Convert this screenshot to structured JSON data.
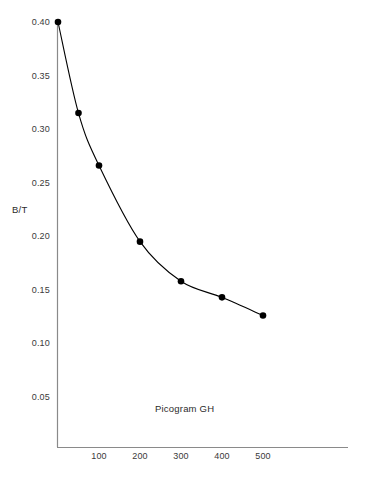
{
  "chart_data": {
    "type": "line",
    "title": "",
    "subtitle": "",
    "xlabel": "",
    "ylabel": "B/T",
    "annotation": "Picogram GH",
    "x": [
      0,
      50,
      100,
      200,
      300,
      400,
      500
    ],
    "values": [
      0.4,
      0.315,
      0.266,
      0.195,
      0.158,
      0.143,
      0.126
    ],
    "series": [
      {
        "name": "B/T vs Picogram GH",
        "x": [
          0,
          50,
          100,
          200,
          300,
          400,
          500
        ],
        "values": [
          0.4,
          0.315,
          0.266,
          0.195,
          0.158,
          0.143,
          0.126
        ]
      }
    ],
    "xlim": [
      0,
      710
    ],
    "ylim": [
      0.0,
      0.42
    ],
    "grid": false,
    "legend": false,
    "legend_position": "none",
    "marker": "filled-circle",
    "line_color": "#000000",
    "marker_color": "#000000",
    "axis_color": "#8a8a8a",
    "text_color": "#3a3a3a",
    "background_color": "#ffffff",
    "y_ticks": [
      {
        "value": 0.4,
        "label": "0.40"
      },
      {
        "value": 0.35,
        "label": "0.35"
      },
      {
        "value": 0.3,
        "label": "0.30"
      },
      {
        "value": 0.25,
        "label": "0.25"
      },
      {
        "value": 0.2,
        "label": "0.20"
      },
      {
        "value": 0.15,
        "label": "0.15"
      },
      {
        "value": 0.1,
        "label": "0.10"
      },
      {
        "value": 0.05,
        "label": "0.05"
      }
    ],
    "x_ticks": [
      {
        "value": 100,
        "label": "100"
      },
      {
        "value": 200,
        "label": "200"
      },
      {
        "value": 300,
        "label": "300"
      },
      {
        "value": 400,
        "label": "400"
      },
      {
        "value": 500,
        "label": "500"
      }
    ]
  }
}
